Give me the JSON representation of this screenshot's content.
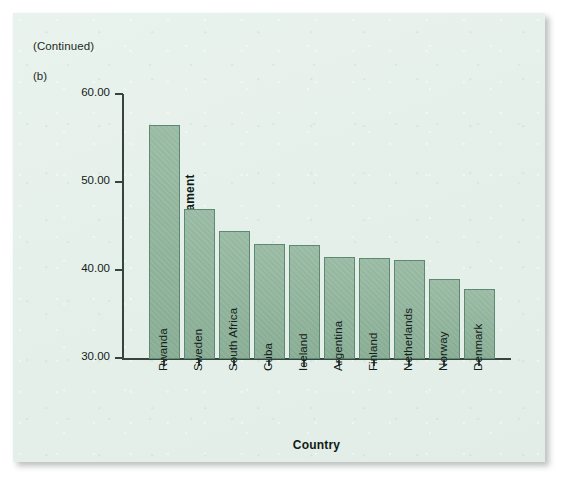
{
  "figure": {
    "continued_label": "(Continued)",
    "panel_letter": "(b)"
  },
  "colors": {
    "panel_background": "#e3efe8",
    "bar_fill": "#8fb49b",
    "bar_outline": "#5f8873",
    "axis": "#35443c",
    "text": "#14201a"
  },
  "chart_data": {
    "type": "bar",
    "title": "",
    "xlabel": "Country",
    "ylabel": "% of Women in the Parliament",
    "categories": [
      "Rwanda",
      "Sweden",
      "South Africa",
      "Cuba",
      "Iceland",
      "Argentina",
      "Finland",
      "Netherlands",
      "Norway",
      "Denmark"
    ],
    "values": [
      56.6,
      47.0,
      44.5,
      43.1,
      42.9,
      41.6,
      41.5,
      41.3,
      39.1,
      38.0
    ],
    "ylim": [
      30.0,
      60.0
    ],
    "y_ticks": [
      30.0,
      40.0,
      50.0,
      60.0
    ],
    "y_tick_labels": [
      "30.00",
      "40.00",
      "50.00",
      "60.00"
    ],
    "grid": false,
    "legend": false
  }
}
